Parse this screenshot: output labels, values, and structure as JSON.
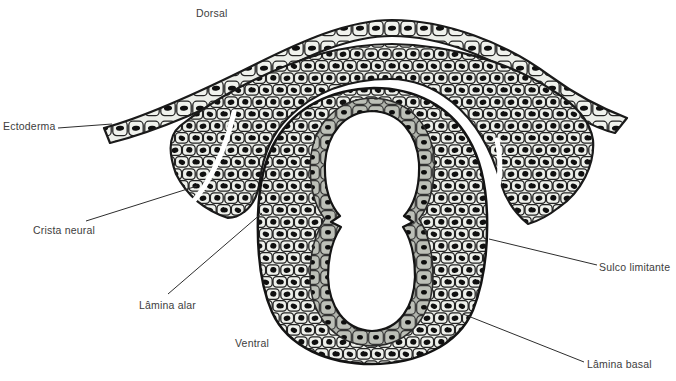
{
  "labels": {
    "dorsal": "Dorsal",
    "ectoderma": "Ectoderma",
    "crista_neural": "Crista neural",
    "lamina_alar": "Lâmina alar",
    "ventral": "Ventral",
    "sulco_limitante": "Sulco limitante",
    "lamina_basal": "Lâmina basal"
  },
  "colors": {
    "background": "#ffffff",
    "cell_fill": "#e9ebe6",
    "cell_fill_light": "#eef0eb",
    "ectoderm_cell_fill": "#eceee9",
    "lining_fill": "#aeb1aa",
    "lining_cell_fill": "#bcbfb7",
    "nucleus": "#101010",
    "outline": "#1a1a1a",
    "lumen": "#ffffff",
    "label_text": "#3d3d3d"
  }
}
